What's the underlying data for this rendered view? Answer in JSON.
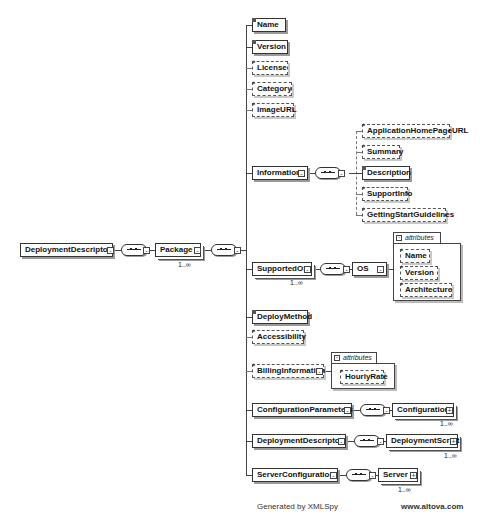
{
  "diagram": {
    "root": {
      "label": "DeploymentDescriptor"
    },
    "package": {
      "label": "Package",
      "cardinality": "1..∞"
    },
    "children": [
      {
        "label": "Name",
        "optional": false
      },
      {
        "label": "Version",
        "optional": false
      },
      {
        "label": "License",
        "optional": true
      },
      {
        "label": "Category",
        "optional": true
      },
      {
        "label": "ImageURL",
        "optional": true
      },
      {
        "label": "Information",
        "optional": false
      },
      {
        "label": "SupportedOS",
        "optional": false,
        "cardinality": "1..∞"
      },
      {
        "label": "DeployMethod",
        "optional": false
      },
      {
        "label": "Accessibility",
        "optional": true
      },
      {
        "label": "BillingInformation",
        "optional": true
      },
      {
        "label": "ConfigurationParameters",
        "optional": false
      },
      {
        "label": "DeploymentDescriptor",
        "optional": false
      },
      {
        "label": "ServerConfiguration",
        "optional": false
      }
    ],
    "information_children": [
      {
        "label": "ApplicationHomePageURL",
        "optional": true
      },
      {
        "label": "Summary",
        "optional": true
      },
      {
        "label": "Description",
        "optional": false
      },
      {
        "label": "SupportInfo",
        "optional": true
      },
      {
        "label": "GettingStartGuidelines",
        "optional": true
      }
    ],
    "os": {
      "label": "OS",
      "attributes_label": "attributes",
      "attributes": [
        "Name",
        "Version",
        "Architecture"
      ]
    },
    "billing": {
      "attributes_label": "attributes",
      "attributes": [
        "HourlyRate"
      ]
    },
    "configuration": {
      "label": "Configuration",
      "cardinality": "1..∞"
    },
    "deployment_script": {
      "label": "DeploymentScript",
      "cardinality": "1..∞"
    },
    "server": {
      "label": "Server",
      "cardinality": "1..∞"
    }
  },
  "footer": {
    "generated": "Generated by XMLSpy",
    "url": "www.altova.com"
  }
}
